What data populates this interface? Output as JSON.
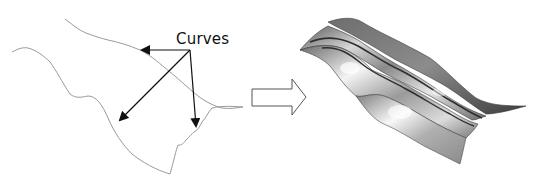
{
  "diagram": {
    "annotation": {
      "label": "Curves",
      "arrow_count": 3
    },
    "input": {
      "name": "input-curves",
      "curve_count": 2,
      "stroke_color": "#9a9a9a"
    },
    "transition_arrow": {
      "type": "block-arrow",
      "direction": "right",
      "stroke_color": "#555555"
    },
    "output": {
      "name": "lofted-surface",
      "shade_light": "#f2f2f2",
      "shade_mid": "#9c9c9c",
      "shade_dark": "#4a4a4a"
    }
  }
}
